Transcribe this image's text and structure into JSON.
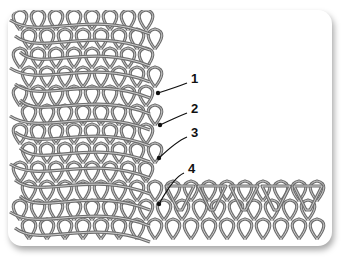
{
  "figure": {
    "callouts": [
      {
        "number": "1",
        "x": 191,
        "y": 77,
        "target_x": 158,
        "target_y": 93
      },
      {
        "number": "2",
        "x": 191,
        "y": 107,
        "target_x": 160,
        "target_y": 125
      },
      {
        "number": "3",
        "x": 191,
        "y": 131,
        "target_x": 159,
        "target_y": 158
      },
      {
        "number": "4",
        "x": 188,
        "y": 167,
        "target_x": 159,
        "target_y": 204
      }
    ],
    "colors": {
      "yarn": "#6e6e6e",
      "yarn_highlight": "#bdbdbd",
      "background": "#ffffff",
      "arrow": "#111111"
    }
  }
}
